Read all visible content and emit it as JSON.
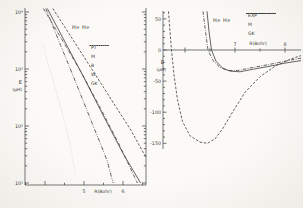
{
  "figure": {
    "background": "#f3f2ee",
    "ink": "#3c3c3c",
    "faint_ink": "#c6c6bf"
  },
  "chart_data": [
    {
      "id": "left",
      "type": "line",
      "title": "He He",
      "xlabel": "R(Bohr)",
      "ylabel": "E",
      "ylabel_unit": "(μH)",
      "x_axis": {
        "min": 3.5,
        "max": 6.6,
        "minor_step": 0.5,
        "labeled_ticks": [
          {
            "value": 5,
            "label": "5"
          },
          {
            "value": 6,
            "label": "6"
          }
        ]
      },
      "y_axis": {
        "scale": "log",
        "min": 10,
        "max": 11700,
        "grid": false,
        "labeled_ticks": [
          {
            "exp": 1,
            "label": "10¹"
          },
          {
            "exp": 2,
            "label": "10²"
          },
          {
            "exp": 3,
            "label": "10³"
          },
          {
            "exp": 4,
            "label": "10⁴"
          }
        ]
      },
      "legend_position": "center-right",
      "series": [
        {
          "name": "PT",
          "style": "solid",
          "color": "#3c3c3c",
          "points": [
            [
              4.06,
              11500
            ],
            [
              4.5,
              3100
            ],
            [
              5.0,
              700
            ],
            [
              5.5,
              150
            ],
            [
              6.0,
              33
            ],
            [
              6.45,
              10
            ]
          ]
        },
        {
          "name": "M",
          "style": "dashdot",
          "color": "#3c3c3c",
          "points": [
            [
              3.96,
              11500
            ],
            [
              4.4,
              3600
            ],
            [
              4.9,
              950
            ],
            [
              5.4,
              220
            ],
            [
              5.9,
              48
            ],
            [
              6.37,
              10
            ]
          ]
        },
        {
          "name": "B",
          "style": "dash",
          "color": "#3c3c3c",
          "points": [
            [
              4.2,
              11500
            ],
            [
              4.7,
              3400
            ],
            [
              5.2,
              1000
            ],
            [
              5.7,
              290
            ],
            [
              6.2,
              85
            ],
            [
              6.59,
              28
            ]
          ]
        },
        {
          "name": "W",
          "style": "dashdotdot",
          "color": "#3c3c3c",
          "points": [
            [
              4.02,
              11500
            ],
            [
              4.4,
              2600
            ],
            [
              4.8,
              560
            ],
            [
              5.2,
              115
            ],
            [
              5.5,
              36
            ],
            [
              5.6,
              24
            ],
            [
              5.7,
              13
            ],
            [
              5.75,
              10
            ]
          ]
        },
        {
          "name": "GK",
          "style": "dot",
          "color": "#c6c6bf",
          "points": [
            [
              3.95,
              2600
            ],
            [
              4.1,
              1100
            ],
            [
              4.3,
              380
            ],
            [
              4.5,
              120
            ],
            [
              4.65,
              45
            ],
            [
              4.78,
              14
            ]
          ]
        }
      ]
    },
    {
      "id": "right",
      "type": "line",
      "title": "He He",
      "xlabel": "R(Bohr)",
      "ylabel": "E",
      "ylabel_unit": "(μH)",
      "x_axis": {
        "min": 5.56,
        "max": 8.32,
        "minor_step": 0.5,
        "labeled_ticks": [
          {
            "value": 7,
            "label": "7"
          },
          {
            "value": 8,
            "label": "8"
          }
        ]
      },
      "y_axis": {
        "scale": "linear",
        "min": -160,
        "max": 62,
        "tick_step": 10,
        "grid": false,
        "labeled_ticks": [
          {
            "value": 50,
            "label": "50"
          },
          {
            "value": 0,
            "label": "0"
          },
          {
            "value": -50,
            "label": "-50"
          },
          {
            "value": -100,
            "label": "-100"
          },
          {
            "value": -150,
            "label": "-150"
          }
        ]
      },
      "legend_position": "top-right",
      "series": [
        {
          "name": "EXP",
          "style": "solid",
          "color": "#3c3c3c",
          "points": [
            [
              6.44,
              62
            ],
            [
              6.48,
              30
            ],
            [
              6.53,
              0
            ],
            [
              6.62,
              -18
            ],
            [
              6.75,
              -29
            ],
            [
              6.9,
              -34
            ],
            [
              7.1,
              -35
            ],
            [
              7.35,
              -31
            ],
            [
              7.7,
              -26
            ],
            [
              8.0,
              -21
            ],
            [
              8.32,
              -17
            ]
          ]
        },
        {
          "name": "M",
          "style": "dashdot",
          "color": "#3c3c3c",
          "points": [
            [
              6.36,
              62
            ],
            [
              6.41,
              30
            ],
            [
              6.46,
              0
            ],
            [
              6.56,
              -17
            ],
            [
              6.7,
              -28
            ],
            [
              6.85,
              -33
            ],
            [
              7.05,
              -33
            ],
            [
              7.3,
              -29
            ],
            [
              7.7,
              -23
            ],
            [
              8.0,
              -18
            ],
            [
              8.32,
              -13
            ]
          ]
        },
        {
          "name": "GK",
          "style": "dash",
          "color": "#3c3c3c",
          "points": [
            [
              5.67,
              62
            ],
            [
              5.7,
              30
            ],
            [
              5.73,
              0
            ],
            [
              5.78,
              -40
            ],
            [
              5.85,
              -80
            ],
            [
              5.95,
              -115
            ],
            [
              6.1,
              -138
            ],
            [
              6.3,
              -148
            ],
            [
              6.45,
              -150
            ],
            [
              6.6,
              -143
            ],
            [
              6.75,
              -127
            ],
            [
              6.95,
              -100
            ],
            [
              7.2,
              -68
            ],
            [
              7.5,
              -43
            ],
            [
              7.8,
              -26
            ],
            [
              8.1,
              -15
            ],
            [
              8.32,
              -9
            ]
          ]
        }
      ]
    }
  ]
}
